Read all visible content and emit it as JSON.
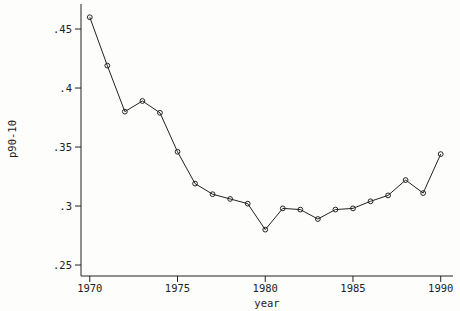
{
  "chart_data": {
    "type": "line",
    "xlabel": "year",
    "ylabel": "p90-10",
    "x": [
      1970,
      1971,
      1972,
      1973,
      1974,
      1975,
      1976,
      1977,
      1978,
      1979,
      1980,
      1981,
      1982,
      1983,
      1984,
      1985,
      1986,
      1987,
      1988,
      1989,
      1990
    ],
    "values": [
      0.46,
      0.419,
      0.38,
      0.389,
      0.379,
      0.346,
      0.319,
      0.31,
      0.306,
      0.302,
      0.28,
      0.298,
      0.297,
      0.289,
      0.297,
      0.298,
      0.304,
      0.309,
      0.322,
      0.311,
      0.344
    ],
    "xticks": {
      "values": [
        1970,
        1975,
        1980,
        1985,
        1990
      ],
      "labels": [
        "1970",
        "1975",
        "1980",
        "1985",
        "1990"
      ]
    },
    "yticks": {
      "values": [
        0.25,
        0.3,
        0.35,
        0.4,
        0.45
      ],
      "labels": [
        ".25",
        ".3",
        ".35",
        ".4",
        ".45"
      ]
    },
    "xlim": [
      1969.5,
      1990.7
    ],
    "ylim": [
      0.2407,
      0.4712
    ],
    "grid": false,
    "legend": null,
    "marker": "open-circle",
    "marker_radius": 2.4,
    "line_color": "#222222",
    "background_color": "#fdfdfc",
    "text_color": "#222222"
  }
}
